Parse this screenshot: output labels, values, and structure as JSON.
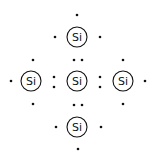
{
  "diagram": {
    "element_symbol": "Si",
    "atoms": [
      {
        "id": "top",
        "label": "Si",
        "x": 77,
        "y": 37
      },
      {
        "id": "left",
        "label": "Si",
        "x": 31,
        "y": 81
      },
      {
        "id": "center",
        "label": "Si",
        "x": 77,
        "y": 81
      },
      {
        "id": "right",
        "label": "Si",
        "x": 123,
        "y": 81
      },
      {
        "id": "bottom",
        "label": "Si",
        "x": 77,
        "y": 127
      }
    ],
    "electrons": [
      [
        77,
        15
      ],
      [
        55,
        37
      ],
      [
        100,
        37
      ],
      [
        33,
        60
      ],
      [
        74,
        60
      ],
      [
        82,
        60
      ],
      [
        123,
        60
      ],
      [
        11,
        81
      ],
      [
        54,
        77
      ],
      [
        54,
        87
      ],
      [
        100,
        77
      ],
      [
        100,
        87
      ],
      [
        145,
        81
      ],
      [
        33,
        104
      ],
      [
        74,
        105
      ],
      [
        82,
        105
      ],
      [
        123,
        104
      ],
      [
        56,
        127
      ],
      [
        101,
        127
      ],
      [
        78,
        149
      ]
    ],
    "colors": {
      "ink": "#111111",
      "background": "#ffffff"
    }
  }
}
